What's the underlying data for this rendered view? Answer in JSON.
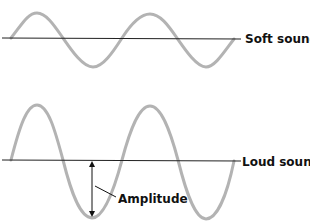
{
  "colors": {
    "wave": "#b3b3b3",
    "axis": "#222222",
    "label": "#111111",
    "background": "#ffffff"
  },
  "waves": [
    {
      "id": "soft",
      "label": "Soft sound",
      "cycles": 2,
      "relative_amplitude": "small"
    },
    {
      "id": "loud",
      "label": "Loud sound",
      "cycles": 2,
      "relative_amplitude": "large"
    }
  ],
  "annotation": {
    "label": "Amplitude",
    "target_wave": "loud",
    "description": "Double-headed arrow from the rest line to the trough"
  }
}
